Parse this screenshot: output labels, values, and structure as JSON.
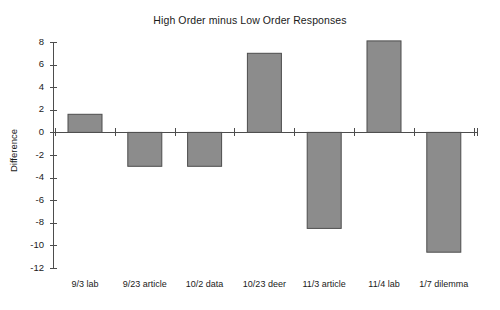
{
  "chart_data": {
    "type": "bar",
    "title": "High Order minus Low Order Responses",
    "xlabel": "",
    "ylabel": "Difference",
    "categories": [
      "9/3 lab",
      "9/23 article",
      "10/2 data",
      "10/23 deer",
      "11/3 article",
      "11/4 lab",
      "1/7 dilemma"
    ],
    "values": [
      1.6,
      -3.0,
      -3.0,
      7.0,
      -8.5,
      8.1,
      -10.6
    ],
    "ylim": [
      -12,
      8
    ],
    "ytick_labels": [
      "8",
      "6",
      "4",
      "2",
      "0",
      "-2",
      "-4",
      "-6",
      "-8",
      "-10",
      "-12"
    ],
    "ytick_values": [
      8,
      6,
      4,
      2,
      0,
      -2,
      -4,
      -6,
      -8,
      -10,
      -12
    ],
    "grid": false,
    "legend": null,
    "bar_color": "#8c8c8c",
    "bar_edge_color": "#4d4d4d",
    "axis_color": "#4d4d4d",
    "background": "#ffffff"
  }
}
